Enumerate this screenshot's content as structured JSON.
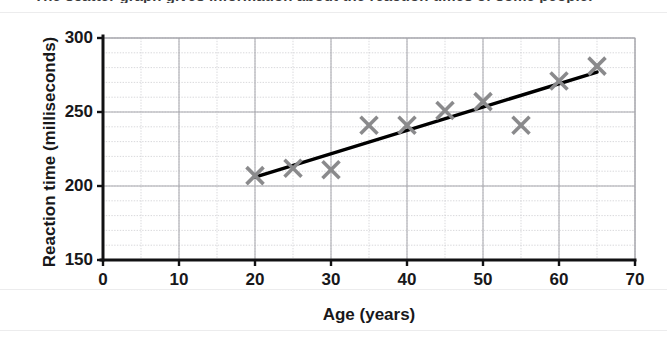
{
  "clipped_heading": "The scatter graph gives information about the reaction times of some people.",
  "chart_data": {
    "type": "scatter",
    "title": "",
    "xlabel": "Age (years)",
    "ylabel": "Reaction time (milliseconds)",
    "xlim": [
      0,
      70
    ],
    "ylim": [
      150,
      300
    ],
    "x_ticks": [
      0,
      10,
      20,
      30,
      40,
      50,
      60,
      70
    ],
    "y_ticks": [
      150,
      200,
      250,
      300
    ],
    "x_tick_labels": [
      "0",
      "10",
      "20",
      "30",
      "40",
      "50",
      "60",
      "70"
    ],
    "y_tick_labels": [
      "150",
      "200",
      "250",
      "300"
    ],
    "x_minor_step": 5,
    "y_minor_step": 10,
    "grid": true,
    "legend": "none",
    "marker": "x",
    "marker_color": "#8a8a8c",
    "line_color": "#000000",
    "points": [
      {
        "age": 20,
        "reaction_time": 207
      },
      {
        "age": 25,
        "reaction_time": 212
      },
      {
        "age": 30,
        "reaction_time": 211
      },
      {
        "age": 35,
        "reaction_time": 241
      },
      {
        "age": 40,
        "reaction_time": 241
      },
      {
        "age": 45,
        "reaction_time": 251
      },
      {
        "age": 50,
        "reaction_time": 257
      },
      {
        "age": 55,
        "reaction_time": 241
      },
      {
        "age": 60,
        "reaction_time": 271
      },
      {
        "age": 65,
        "reaction_time": 281
      }
    ],
    "trend_line": {
      "label": "line of best fit",
      "x_start": 20,
      "y_start": 206,
      "x_end": 65,
      "y_end": 277
    }
  }
}
